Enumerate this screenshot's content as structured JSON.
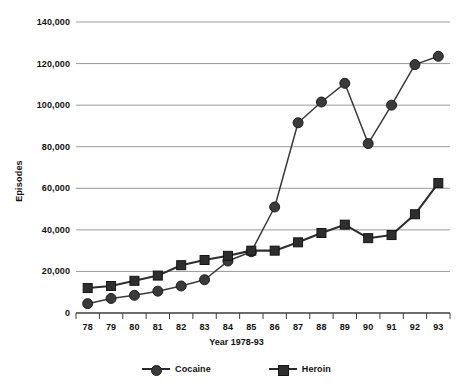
{
  "chart_data": {
    "type": "line",
    "title": "",
    "xlabel": "Year 1978-93",
    "ylabel": "Episodes",
    "categories": [
      "78",
      "79",
      "80",
      "81",
      "82",
      "83",
      "84",
      "85",
      "86",
      "87",
      "88",
      "89",
      "90",
      "91",
      "92",
      "93"
    ],
    "series": [
      {
        "name": "Cocaine",
        "marker": "circle",
        "color": "#3a3a3a",
        "values": [
          4500,
          7000,
          8500,
          10500,
          13000,
          16000,
          25000,
          29500,
          51000,
          91500,
          101500,
          110500,
          81500,
          100000,
          119500,
          123500
        ]
      },
      {
        "name": "Heroin",
        "marker": "square",
        "color": "#2e2e2e",
        "values": [
          12000,
          13000,
          15500,
          18000,
          23000,
          25500,
          27500,
          30000,
          30000,
          34000,
          38500,
          42500,
          36000,
          37500,
          47500,
          62500
        ]
      }
    ],
    "ylim": [
      0,
      140000
    ],
    "yticks": [
      0,
      20000,
      40000,
      60000,
      80000,
      100000,
      120000,
      140000
    ],
    "ytick_labels": [
      "0",
      "20,000",
      "40,000",
      "60,000",
      "80,000",
      "100,000",
      "120,000",
      "140,000"
    ],
    "grid": "horizontal",
    "legend_position": "bottom"
  },
  "legend": {
    "items": [
      {
        "label": "Cocaine",
        "marker": "circle-marker-icon"
      },
      {
        "label": "Heroin",
        "marker": "square-marker-icon"
      }
    ]
  },
  "axes": {
    "y_title": "Episodes",
    "x_title": "Year 1978-93"
  },
  "colors": {
    "grid": "#9a9a9a",
    "axis": "#3d3d3d",
    "cocaine": "#3a3a3a",
    "heroin": "#2e2e2e",
    "text": "#111111",
    "background": "#ffffff"
  }
}
